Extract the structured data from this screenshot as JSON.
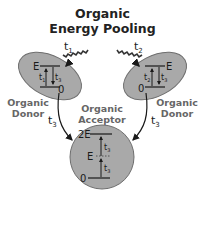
{
  "title": {
    "line1": "Organic",
    "line2": "Energy Pooling"
  },
  "labels": {
    "donor_left": [
      "Organic",
      "Donor"
    ],
    "donor_right": [
      "Organic",
      "Donor"
    ],
    "acceptor": [
      "Organic",
      "Acceptor"
    ]
  },
  "donor_left": {
    "level_top": "E",
    "level_bottom": "0",
    "up_time": "t",
    "up_sub": "1",
    "down_time": "t",
    "down_sub": "3",
    "photon_time": "t",
    "photon_sub": "1"
  },
  "donor_right": {
    "level_top": "E",
    "level_bottom": "0",
    "up_time": "t",
    "up_sub": "2",
    "down_time": "t",
    "down_sub": "3",
    "photon_time": "t",
    "photon_sub": "2"
  },
  "acceptor": {
    "level_top": "2E",
    "level_mid": "E",
    "level_bottom": "0",
    "upper_time": "t",
    "upper_sub": "3",
    "lower_time": "t",
    "lower_sub": "3"
  },
  "transfer_arrows": {
    "left_time": "t",
    "left_sub": "3",
    "right_time": "t",
    "right_sub": "3"
  },
  "colors": {
    "shape_fill": "#a9a9a9",
    "shape_stroke": "#6e6e6e",
    "line": "#1a1a1a",
    "label_gray": "#666666",
    "title": "#222222"
  }
}
